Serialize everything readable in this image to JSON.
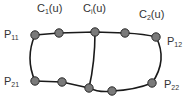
{
  "diagram": {
    "type": "curve-network",
    "colors": {
      "curve": "#1a1a1a",
      "node_fill": "#7a7a7a",
      "node_stroke": "#2a2a2a",
      "label": "#333333"
    },
    "curve_labels": [
      {
        "base": "C",
        "sub": "1",
        "arg": "(u)",
        "x": 37,
        "y": 3
      },
      {
        "base": "C",
        "sub": "i",
        "arg": "(u)",
        "x": 83,
        "y": 3
      },
      {
        "base": "C",
        "sub": "2",
        "arg": "(u)",
        "x": 139,
        "y": 9
      }
    ],
    "corner_labels": [
      {
        "base": "P",
        "sub": "11",
        "x": 4,
        "y": 29
      },
      {
        "base": "P",
        "sub": "12",
        "x": 167,
        "y": 36
      },
      {
        "base": "P",
        "sub": "21",
        "x": 4,
        "y": 76
      },
      {
        "base": "P",
        "sub": "22",
        "x": 164,
        "y": 79
      }
    ],
    "nodes": [
      {
        "id": "P11",
        "x": 35,
        "y": 35
      },
      {
        "id": "top-1",
        "x": 59,
        "y": 33
      },
      {
        "id": "top-mid",
        "x": 95,
        "y": 32
      },
      {
        "id": "top-3",
        "x": 125,
        "y": 33
      },
      {
        "id": "P12",
        "x": 156,
        "y": 37
      },
      {
        "id": "P21",
        "x": 35,
        "y": 81
      },
      {
        "id": "bot-1",
        "x": 62,
        "y": 82
      },
      {
        "id": "bot-mid",
        "x": 89,
        "y": 88
      },
      {
        "id": "bot-3",
        "x": 112,
        "y": 91
      },
      {
        "id": "P22",
        "x": 152,
        "y": 83
      }
    ]
  }
}
